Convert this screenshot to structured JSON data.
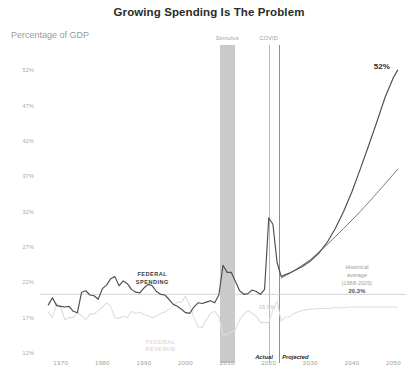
{
  "chart_data": {
    "type": "line",
    "title": "Growing Spending Is The Problem",
    "subtitle": "Percentage of GDP",
    "ylabel": "Percentage of GDP",
    "xlabel": "",
    "grid": false,
    "legend_position": "inline-annotation",
    "xlim": [
      1965,
      2053
    ],
    "ylim": [
      12,
      54
    ],
    "x_ticks": [
      "1970",
      "1980",
      "1990",
      "2000",
      "2010",
      "2020",
      "2030",
      "2040",
      "2050"
    ],
    "x_tick_values": [
      1970,
      1980,
      1990,
      2000,
      2010,
      2020,
      2030,
      2040,
      2050
    ],
    "y_ticks": [
      "12%",
      "17%",
      "22%",
      "27%",
      "32%",
      "37%",
      "42%",
      "47%",
      "52%"
    ],
    "y_tick_values": [
      12,
      17,
      22,
      27,
      32,
      37,
      42,
      47,
      52
    ],
    "series": [
      {
        "name": "Federal Spending",
        "color": "#4d4d4d",
        "points": [
          [
            1967,
            18.8
          ],
          [
            1968,
            19.8
          ],
          [
            1969,
            18.7
          ],
          [
            1970,
            18.6
          ],
          [
            1971,
            18.5
          ],
          [
            1972,
            18.6
          ],
          [
            1973,
            17.9
          ],
          [
            1974,
            17.7
          ],
          [
            1975,
            20.6
          ],
          [
            1976,
            20.8
          ],
          [
            1977,
            20.2
          ],
          [
            1978,
            20.1
          ],
          [
            1979,
            19.6
          ],
          [
            1980,
            21.1
          ],
          [
            1981,
            21.6
          ],
          [
            1982,
            22.5
          ],
          [
            1983,
            22.8
          ],
          [
            1984,
            21.5
          ],
          [
            1985,
            22.2
          ],
          [
            1986,
            21.8
          ],
          [
            1987,
            21.0
          ],
          [
            1988,
            20.6
          ],
          [
            1989,
            20.5
          ],
          [
            1990,
            21.2
          ],
          [
            1991,
            21.7
          ],
          [
            1992,
            21.5
          ],
          [
            1993,
            20.7
          ],
          [
            1994,
            20.3
          ],
          [
            1995,
            20.2
          ],
          [
            1996,
            19.6
          ],
          [
            1997,
            18.9
          ],
          [
            1998,
            18.6
          ],
          [
            1999,
            18.2
          ],
          [
            2000,
            17.7
          ],
          [
            2001,
            17.6
          ],
          [
            2002,
            18.5
          ],
          [
            2003,
            19.1
          ],
          [
            2004,
            19.0
          ],
          [
            2005,
            19.2
          ],
          [
            2006,
            19.4
          ],
          [
            2007,
            19.1
          ],
          [
            2008,
            20.2
          ],
          [
            2009,
            24.4
          ],
          [
            2010,
            23.4
          ],
          [
            2011,
            23.4
          ],
          [
            2012,
            22.1
          ],
          [
            2013,
            20.8
          ],
          [
            2014,
            20.3
          ],
          [
            2015,
            20.4
          ],
          [
            2016,
            20.9
          ],
          [
            2017,
            20.7
          ],
          [
            2018,
            20.3
          ],
          [
            2019,
            21.0
          ],
          [
            2020,
            31.1
          ],
          [
            2021,
            30.2
          ],
          [
            2022,
            24.8
          ],
          [
            2023,
            22.8
          ],
          [
            2024,
            23.1
          ],
          [
            2025,
            23.3
          ],
          [
            2026,
            23.6
          ],
          [
            2028,
            24.2
          ],
          [
            2030,
            25.0
          ],
          [
            2032,
            26.1
          ],
          [
            2034,
            27.6
          ],
          [
            2036,
            29.6
          ],
          [
            2038,
            32.0
          ],
          [
            2040,
            34.8
          ],
          [
            2042,
            38.0
          ],
          [
            2044,
            41.3
          ],
          [
            2046,
            44.7
          ],
          [
            2048,
            48.2
          ],
          [
            2050,
            51.0
          ],
          [
            2051,
            52.0
          ]
        ]
      },
      {
        "name": "Federal Revenue",
        "color": "#dedede",
        "points": [
          [
            1967,
            17.8
          ],
          [
            1968,
            17.0
          ],
          [
            1969,
            19.0
          ],
          [
            1970,
            18.4
          ],
          [
            1971,
            16.7
          ],
          [
            1972,
            17.0
          ],
          [
            1973,
            17.0
          ],
          [
            1974,
            17.7
          ],
          [
            1975,
            17.3
          ],
          [
            1976,
            16.7
          ],
          [
            1977,
            17.5
          ],
          [
            1978,
            17.5
          ],
          [
            1979,
            18.0
          ],
          [
            1980,
            18.5
          ],
          [
            1981,
            19.1
          ],
          [
            1982,
            18.6
          ],
          [
            1983,
            17.0
          ],
          [
            1984,
            16.9
          ],
          [
            1985,
            17.2
          ],
          [
            1986,
            17.0
          ],
          [
            1987,
            17.9
          ],
          [
            1988,
            17.6
          ],
          [
            1989,
            17.8
          ],
          [
            1990,
            17.4
          ],
          [
            1991,
            17.3
          ],
          [
            1992,
            17.0
          ],
          [
            1993,
            17.2
          ],
          [
            1994,
            17.6
          ],
          [
            1995,
            17.8
          ],
          [
            1996,
            18.2
          ],
          [
            1997,
            18.6
          ],
          [
            1998,
            19.2
          ],
          [
            1999,
            19.2
          ],
          [
            2000,
            20.0
          ],
          [
            2001,
            18.8
          ],
          [
            2002,
            17.0
          ],
          [
            2003,
            15.7
          ],
          [
            2004,
            15.6
          ],
          [
            2005,
            16.7
          ],
          [
            2006,
            17.6
          ],
          [
            2007,
            17.9
          ],
          [
            2008,
            17.1
          ],
          [
            2009,
            14.6
          ],
          [
            2010,
            14.6
          ],
          [
            2011,
            15.0
          ],
          [
            2012,
            15.3
          ],
          [
            2013,
            16.7
          ],
          [
            2014,
            17.5
          ],
          [
            2015,
            18.0
          ],
          [
            2016,
            17.6
          ],
          [
            2017,
            17.2
          ],
          [
            2018,
            16.3
          ],
          [
            2019,
            16.3
          ],
          [
            2020,
            16.3
          ],
          [
            2021,
            18.1
          ],
          [
            2022,
            19.3
          ],
          [
            2023,
            16.5
          ],
          [
            2024,
            17.1
          ],
          [
            2025,
            17.1
          ],
          [
            2026,
            17.6
          ],
          [
            2028,
            18.0
          ],
          [
            2030,
            18.2
          ],
          [
            2032,
            18.3
          ],
          [
            2034,
            18.3
          ],
          [
            2036,
            18.4
          ],
          [
            2038,
            18.4
          ],
          [
            2040,
            18.5
          ],
          [
            2042,
            18.5
          ],
          [
            2044,
            18.5
          ],
          [
            2046,
            18.5
          ],
          [
            2048,
            18.5
          ],
          [
            2050,
            18.5
          ],
          [
            2051,
            18.5
          ]
        ]
      },
      {
        "name": "Historical average (1968-2020)",
        "color": "#6e6e6e",
        "points": [
          [
            2023,
            22.6
          ],
          [
            2026,
            23.6
          ],
          [
            2030,
            25.2
          ],
          [
            2034,
            27.3
          ],
          [
            2038,
            29.6
          ],
          [
            2042,
            32.0
          ],
          [
            2046,
            34.6
          ],
          [
            2050,
            37.3
          ],
          [
            2051,
            38.0
          ]
        ]
      }
    ],
    "reference_line": {
      "label": "Historical average (1968-2020)",
      "value": 20.3,
      "color": "#c9c9c9"
    },
    "annotations": [
      {
        "name": "stimulus",
        "label": "Stimulus",
        "x_start": 2008.2,
        "x_end": 2011.8
      },
      {
        "name": "covid",
        "label": "COVID",
        "x": 2020
      },
      {
        "name": "actual",
        "label": "Actual"
      },
      {
        "name": "projected",
        "label": "Projected"
      },
      {
        "name": "spending-label",
        "label": "FEDERAL\nSPENDING",
        "line1": "FEDERAL",
        "line2": "SPENDING"
      },
      {
        "name": "revenue-label",
        "label": "FEDERAL\nREVENUE",
        "line1": "FEDERAL",
        "line2": "REVENUE"
      },
      {
        "name": "revenue-value",
        "label": "18.5%"
      },
      {
        "name": "peak-value",
        "label": "52%"
      },
      {
        "name": "hist-avg",
        "line1": "Historical",
        "line2": "average",
        "line3": "(1968-2020)",
        "value": "20.3%"
      }
    ]
  },
  "header": {
    "title": "Growing Spending Is The Problem",
    "axis_caption": "Percentage of GDP"
  },
  "colors": {
    "spending": "#4d4d4d",
    "revenue": "#dedede",
    "projection_alt": "#6e6e6e",
    "band": "#c7c7c7",
    "reference": "#c9c9c9",
    "title": "#2b2b2b"
  }
}
